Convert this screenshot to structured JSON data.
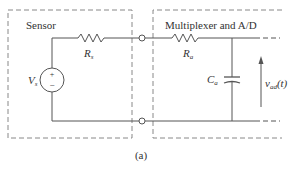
{
  "diagram": {
    "caption": "(a)",
    "sensor_block": {
      "title": "Sensor",
      "resistor_label": "R",
      "resistor_sub": "s",
      "source_label": "V",
      "source_sub": "s",
      "source_plus": "+",
      "source_minus": "−"
    },
    "adc_block": {
      "title": "Multiplexer and A/D",
      "resistor_label": "R",
      "resistor_sub": "a",
      "capacitor_label": "C",
      "capacitor_sub": "a",
      "voltage_label": "v",
      "voltage_sub": "ad",
      "voltage_arg": "(t)"
    },
    "colors": {
      "line": "#555555",
      "dashed_box": "#888888",
      "text": "#333333"
    }
  }
}
